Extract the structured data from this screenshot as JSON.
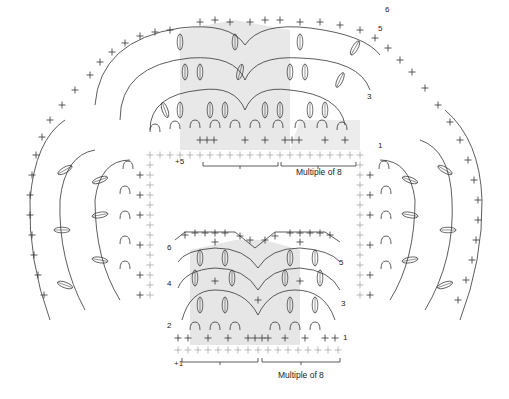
{
  "top_chart": {
    "row_numbers": [
      "1",
      "3",
      "5",
      "6"
    ],
    "edge_label": "+5",
    "repeat_label": "Multiple of 8"
  },
  "bottom_chart": {
    "row_numbers_left": [
      "2",
      "4",
      "6"
    ],
    "row_numbers_right": [
      "1",
      "3",
      "5"
    ],
    "edge_label": "+1",
    "repeat_label": "Multiple of 8"
  },
  "colors": {
    "ink": "#333333",
    "shading": "#e6e6e6",
    "foundation": "#aaaaaa"
  }
}
